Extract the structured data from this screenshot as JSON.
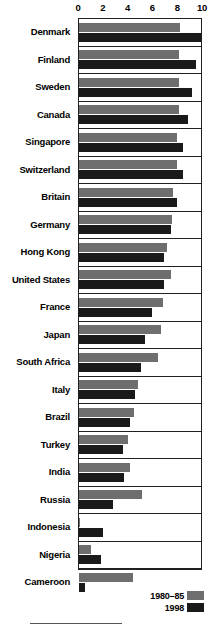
{
  "chart_data": {
    "type": "bar",
    "orientation": "horizontal",
    "title": "",
    "xlabel": "",
    "ylabel": "",
    "xlim": [
      0,
      10
    ],
    "xticks": [
      0,
      2,
      4,
      6,
      8,
      10
    ],
    "xtick_labels": [
      "0",
      "2",
      "4",
      "6",
      "8",
      "10"
    ],
    "grid": false,
    "legend_position": "bottom-right",
    "categories": [
      "Denmark",
      "Finland",
      "Sweden",
      "Canada",
      "Singapore",
      "Switzerland",
      "Britain",
      "Germany",
      "Hong Kong",
      "United States",
      "France",
      "Japan",
      "South Africa",
      "Italy",
      "Brazil",
      "Turkey",
      "India",
      "Russia",
      "Indonesia",
      "Nigeria",
      "Cameroon"
    ],
    "series": [
      {
        "name": "1980-85",
        "color": "#6e6e6e",
        "values": [
          8.3,
          8.2,
          8.2,
          8.2,
          8.0,
          8.0,
          7.7,
          7.6,
          7.2,
          7.5,
          6.9,
          6.7,
          6.5,
          4.8,
          4.5,
          4.0,
          4.2,
          5.2,
          0.1,
          1.0,
          4.4
        ]
      },
      {
        "name": "1998",
        "color": "#1a1a1a",
        "values": [
          10.0,
          9.6,
          9.3,
          8.9,
          8.5,
          8.5,
          8.0,
          7.5,
          7.0,
          7.0,
          6.0,
          5.4,
          5.1,
          4.6,
          4.2,
          3.6,
          3.7,
          2.8,
          2.0,
          1.8,
          0.5
        ]
      }
    ]
  },
  "legend": {
    "entries": [
      {
        "label": "1980–85",
        "swatch": "old"
      },
      {
        "label": "1998",
        "swatch": "new"
      }
    ]
  }
}
